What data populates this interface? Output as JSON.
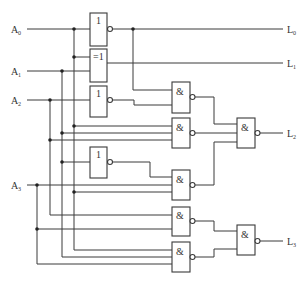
{
  "diagram": {
    "type": "logic-circuit",
    "inputs": [
      {
        "name": "A",
        "sub": "0"
      },
      {
        "name": "A",
        "sub": "1"
      },
      {
        "name": "A",
        "sub": "2"
      },
      {
        "name": "A",
        "sub": "3"
      }
    ],
    "outputs": [
      {
        "name": "L",
        "sub": "0"
      },
      {
        "name": "L",
        "sub": "1"
      },
      {
        "name": "L",
        "sub": "2"
      },
      {
        "name": "L",
        "sub": "3"
      }
    ],
    "gates": {
      "not_a0": {
        "symbol": "1"
      },
      "xor_a0_a1": {
        "symbol": "=1"
      },
      "not_a2": {
        "symbol": "1"
      },
      "not_a1": {
        "symbol": "1"
      },
      "nand_1": {
        "symbol": "&"
      },
      "nand_2": {
        "symbol": "&"
      },
      "nand_3": {
        "symbol": "&"
      },
      "nand_4": {
        "symbol": "&"
      },
      "nand_5": {
        "symbol": "&"
      },
      "nand_l2": {
        "symbol": "&"
      },
      "nand_l3": {
        "symbol": "&"
      }
    },
    "colors": {
      "line": "#3a3a3a",
      "background": "#ffffff"
    }
  }
}
